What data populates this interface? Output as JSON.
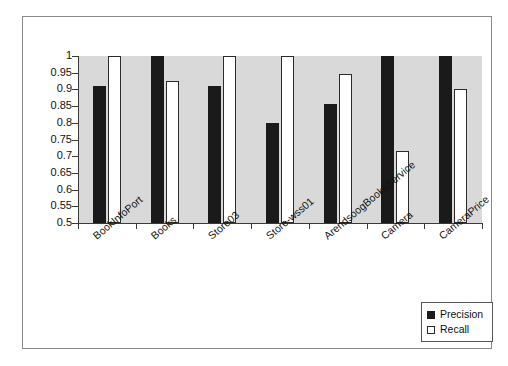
{
  "chart_data": {
    "type": "bar",
    "title": "",
    "xlabel": "",
    "ylabel": "",
    "ylim": [
      0.5,
      1.0
    ],
    "yticks": [
      1,
      0.95,
      0.9,
      0.85,
      0.8,
      0.75,
      0.7,
      0.65,
      0.6,
      0.55,
      0.5
    ],
    "ytick_labels": [
      "1",
      "0.95",
      "0.9",
      "0.85",
      "0.8",
      "0.75",
      "0.7",
      "0.65",
      "0.6",
      "0.55",
      "0.5"
    ],
    "grid": false,
    "legend_position": "bottom-right",
    "categories": [
      "BookInfoPort",
      "Books",
      "Store03",
      "Store-wss01",
      "ArendsoogBooksService",
      "Camera",
      "CameraPrice"
    ],
    "series": [
      {
        "name": "Precision",
        "color": "#1a1a1a",
        "values": [
          0.91,
          1.0,
          0.91,
          0.8,
          0.855,
          1.0,
          1.0
        ]
      },
      {
        "name": "Recall",
        "color": "#ffffff",
        "values": [
          1.0,
          0.925,
          1.0,
          1.0,
          0.945,
          0.715,
          0.9
        ]
      }
    ]
  },
  "legend": {
    "items": [
      {
        "label": "Precision",
        "swatch": "filled-square-icon"
      },
      {
        "label": "Recall",
        "swatch": "hollow-square-icon"
      }
    ]
  },
  "colors": {
    "plot_background": "#d9d9d9",
    "figure_background": "#ffffff",
    "axis": "#3a3a3a",
    "precision": "#1a1a1a",
    "recall": "#ffffff"
  }
}
